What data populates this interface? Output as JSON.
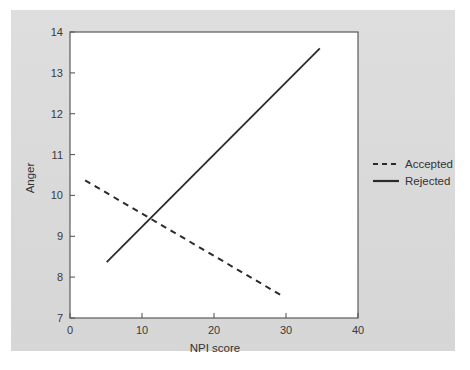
{
  "figure": {
    "background_color": "#dcdcdc",
    "plot_background_color": "#ffffff",
    "axis_color": "#555555",
    "line_color": "#2b2b2b"
  },
  "chart_data": {
    "type": "line",
    "title": "",
    "xlabel": "NPI score",
    "ylabel": "Anger",
    "xlim": [
      0,
      40
    ],
    "ylim": [
      7,
      14
    ],
    "xticks": [
      0,
      10,
      20,
      30,
      40
    ],
    "yticks": [
      7,
      8,
      9,
      10,
      11,
      12,
      13,
      14
    ],
    "xtick_labels": [
      "0",
      "10",
      "20",
      "30",
      "40"
    ],
    "ytick_labels": [
      "7",
      "8",
      "9",
      "10",
      "11",
      "12",
      "13",
      "14"
    ],
    "grid": false,
    "legend_position": "right",
    "series": [
      {
        "name": "Accepted",
        "style": "dashed",
        "color": "#2b2b2b",
        "x": [
          2.1,
          29.3
        ],
        "y": [
          10.37,
          7.56
        ]
      },
      {
        "name": "Rejected",
        "style": "solid",
        "color": "#2b2b2b",
        "x": [
          5.1,
          34.7
        ],
        "y": [
          8.37,
          13.6
        ]
      }
    ],
    "intersection": {
      "x": 11.5,
      "y": 9.33
    }
  },
  "legend": {
    "entries": [
      {
        "label": "Accepted",
        "style": "dashed"
      },
      {
        "label": "Rejected",
        "style": "solid"
      }
    ]
  }
}
